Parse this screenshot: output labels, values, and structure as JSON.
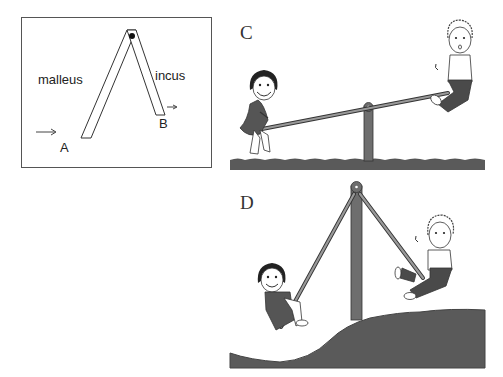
{
  "panel_lever": {
    "labels": {
      "left_arm": "malleus",
      "right_arm": "incus",
      "point_a": "A",
      "point_b": "B"
    },
    "arrows": [
      "input-arrow-at-A",
      "output-arrow-at-B"
    ]
  },
  "panel_c": {
    "label": "C",
    "scene": "seesaw with girl (down) and boy (up) on flat grass"
  },
  "panel_d": {
    "label": "D",
    "scene": "A-frame pendulum-style seesaw on hill with girl and boy"
  },
  "colors": {
    "line": "#333333",
    "pole": "#6e6e6e",
    "grass": "#5a5a5a",
    "clothes_dark": "#4a4a4a"
  }
}
